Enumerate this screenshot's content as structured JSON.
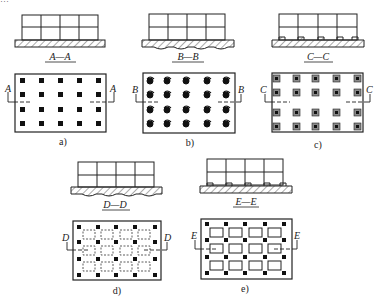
{
  "figure": {
    "top_cropped_text": "…",
    "panels": [
      {
        "id": "a",
        "caption": "a)",
        "section_label": "A—A",
        "cut_letter": "A",
        "foundation": "flat slab",
        "plan_marker": "pile-square"
      },
      {
        "id": "b",
        "caption": "b)",
        "section_label": "B—B",
        "cut_letter": "B",
        "foundation": "slab with curved undersides",
        "plan_marker": "pile-capped-round"
      },
      {
        "id": "c",
        "caption": "c)",
        "section_label": "C—C",
        "cut_letter": "C",
        "foundation": "slab with rectangular downstands",
        "plan_marker": "pile-with-cap"
      },
      {
        "id": "d",
        "caption": "d)",
        "section_label": "D—D",
        "cut_letter": "D",
        "foundation": "slab with curved undersides",
        "plan_marker": "pile-square-with-dashed-cells"
      },
      {
        "id": "e",
        "caption": "e)",
        "section_label": "E—E",
        "cut_letter": "E",
        "foundation": "slab with rectangular downstands",
        "plan_marker": "pile-square-with-solid-cells"
      }
    ],
    "grid": {
      "columns": 5,
      "rows": 4
    },
    "colors": {
      "line": "#222222",
      "fill_gray": "#8a8a8a",
      "hatch": "#444444"
    }
  }
}
